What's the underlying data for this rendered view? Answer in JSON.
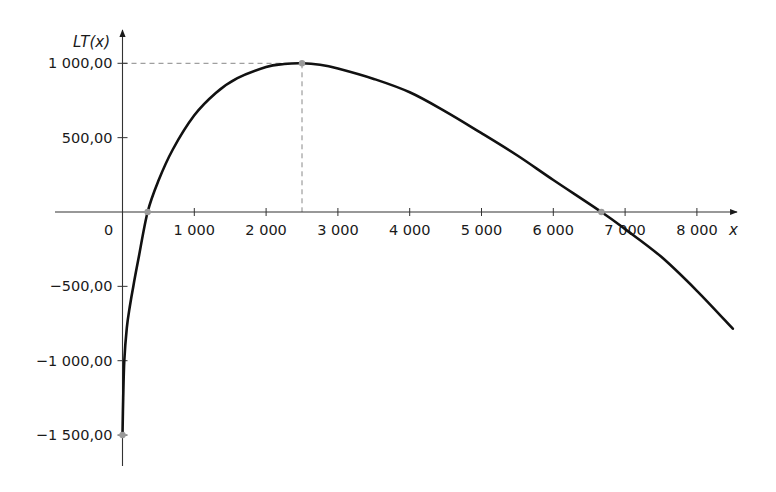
{
  "chart_data": {
    "type": "line",
    "title": "",
    "xlabel": "x",
    "ylabel": "LT(x)",
    "xlim": [
      -900,
      8700
    ],
    "ylim": [
      -1700,
      1200
    ],
    "grid": false,
    "legend": null,
    "x_ticks": [
      {
        "value": 0,
        "label": "0"
      },
      {
        "value": 1000,
        "label": "1 000"
      },
      {
        "value": 2000,
        "label": "2 000"
      },
      {
        "value": 3000,
        "label": "3 000"
      },
      {
        "value": 4000,
        "label": "4 000"
      },
      {
        "value": 5000,
        "label": "5 000"
      },
      {
        "value": 6000,
        "label": "6 000"
      },
      {
        "value": 7000,
        "label": "7 000"
      },
      {
        "value": 8000,
        "label": "8 000"
      }
    ],
    "y_ticks": [
      {
        "value": 1000,
        "label": "1 000,00"
      },
      {
        "value": 500,
        "label": "500,00"
      },
      {
        "value": -500,
        "label": "−500,00"
      },
      {
        "value": -1000,
        "label": "−1 000,00"
      },
      {
        "value": -1500,
        "label": "−1 500,00"
      }
    ],
    "series": [
      {
        "name": "LT(x)",
        "color": "#111111",
        "x": [
          0,
          10,
          25,
          60,
          100,
          150,
          220,
          350,
          500,
          700,
          1000,
          1300,
          1600,
          2000,
          2250,
          2500,
          2750,
          3000,
          3500,
          4000,
          4500,
          5000,
          5500,
          6000,
          6670,
          7000,
          7500,
          8000,
          8500
        ],
        "y": [
          -1500,
          -1250,
          -1000,
          -780,
          -640,
          -500,
          -320,
          0,
          210,
          420,
          650,
          800,
          900,
          975,
          995,
          1000,
          990,
          965,
          895,
          805,
          675,
          530,
          380,
          215,
          0,
          -115,
          -300,
          -530,
          -785
        ]
      }
    ],
    "annotations": [
      {
        "type": "point",
        "x": 0,
        "y": -1500
      },
      {
        "type": "point",
        "x": 350,
        "y": 0
      },
      {
        "type": "point",
        "x": 2500,
        "y": 1000
      },
      {
        "type": "point",
        "x": 6670,
        "y": 0
      },
      {
        "type": "dashed-guide",
        "from": [
          0,
          1000
        ],
        "to": [
          2500,
          1000
        ]
      },
      {
        "type": "dashed-guide",
        "from": [
          2500,
          1000
        ],
        "to": [
          2500,
          0
        ]
      }
    ]
  }
}
